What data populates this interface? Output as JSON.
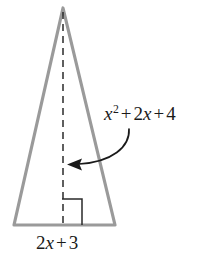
{
  "figure": {
    "type": "geometry-diagram",
    "shape": "isosceles-triangle",
    "background_color": "#ffffff",
    "outline_color": "#9a9a9a",
    "outline_width": 3,
    "altitude_color": "#1a1a1a",
    "annotation_color": "#1a1a1a",
    "width": 213,
    "height": 257
  },
  "labels": {
    "hypotenuse": {
      "text": "x^2 + 2x + 4",
      "parts": {
        "var1": "x",
        "exp1": "2",
        "op1": "+",
        "coef2": "2",
        "var2": "x",
        "op2": "+",
        "const": "4"
      }
    },
    "base": {
      "text": "2x + 3",
      "parts": {
        "coef": "2",
        "var": "x",
        "op": "+",
        "const": "3"
      }
    }
  },
  "geometry": {
    "apex": {
      "x": 63,
      "y": 8
    },
    "base_left": {
      "x": 14,
      "y": 225
    },
    "base_right": {
      "x": 115,
      "y": 225
    },
    "altitude_foot": {
      "x": 63,
      "y": 225
    },
    "right_angle_marker": {
      "x": 62,
      "y": 199,
      "size": 20
    },
    "arrow_start": {
      "x": 128,
      "y": 128
    },
    "arrow_tip": {
      "x": 68,
      "y": 164
    }
  },
  "elements": {
    "triangle_name": "triangle-outline",
    "altitude_name": "altitude-dashed-line",
    "right_angle_name": "right-angle-marker",
    "arrow_name": "leader-arrow"
  }
}
